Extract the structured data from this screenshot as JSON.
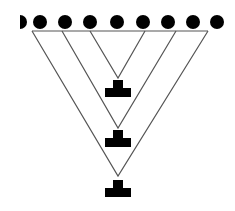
{
  "diagram": {
    "title": "",
    "colors": {
      "dot": "#000000",
      "line": "#555555",
      "symbol": "#000000",
      "background": "#ffffff"
    },
    "dots": {
      "y": 22,
      "radius": 7,
      "x": [
        20,
        40,
        65,
        90,
        117,
        143,
        168,
        193,
        217
      ]
    },
    "top_line": {
      "x1": 32,
      "x2": 208,
      "y": 31
    },
    "triangles": [
      {
        "name": "inner",
        "left_x": 90,
        "right_x": 145,
        "apex_y": 78
      },
      {
        "name": "middle",
        "left_x": 62,
        "right_x": 176,
        "apex_y": 128
      },
      {
        "name": "outer",
        "left_x": 32,
        "right_x": 208,
        "apex_y": 176
      }
    ],
    "t_symbols": [
      {
        "cx": 118,
        "top_y": 80
      },
      {
        "cx": 118,
        "top_y": 130
      },
      {
        "cx": 118,
        "top_y": 180
      }
    ]
  }
}
